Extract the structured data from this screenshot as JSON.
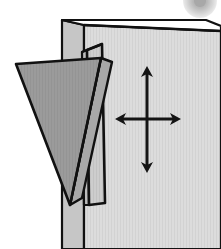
{
  "figure": {
    "canvas": {
      "width": 221,
      "height": 249
    },
    "background_color": "#ffffff"
  },
  "colors": {
    "wall_face": "#d9d9d9",
    "wall_edge_dark": "#b5b5b5",
    "wall_side": "#c9c9c9",
    "rail_face": "#cfcfcf",
    "rail_side": "#bdbdbd",
    "wedge_front": "#9a9a9a",
    "wedge_side": "#a8a8a8",
    "outline": "#111111",
    "arrow": "#141414",
    "corner_blob": "#b9b9b9",
    "corner_blob_core": "#8f8f8f"
  },
  "parts": {
    "wall": {
      "name": "Wall panel",
      "face_points": "84,25 221,31 221,249 84,249",
      "top_edge_points": "62,20 206,20 221,31 84,25",
      "left_side_points": "62,20 84,25 84,249 62,249"
    },
    "rail": {
      "name": "Vertical mounting rail",
      "front_points": "87,50 102,44 105,203 89,205",
      "side_points": "87,50 89,205 84,205 82,52",
      "top_points": "82,52 87,50 102,44 98,46"
    },
    "wedge": {
      "name": "Triangular wedge bracket",
      "front_points": "16,64 101,58 70,205",
      "side_points": "101,58 112,62 82,198 70,205",
      "seam_points": "70,205 101,58"
    }
  },
  "arrows": {
    "name": "Four-way planar motion indicator",
    "center": {
      "x": 147,
      "y": 119
    },
    "vertical": {
      "top_y": 66,
      "bottom_y": 173
    },
    "horizontal": {
      "left_x": 115,
      "right_x": 181
    },
    "stroke_width": 3,
    "head_length": 11,
    "head_half_width": 6,
    "meaning": "movement in the plane of the wall (up, down, left, right)"
  },
  "corner_mark": {
    "name": "Partial circular mark at top-right",
    "cx": 200,
    "cy": 1,
    "r_outer": 17,
    "r_inner": 6
  }
}
